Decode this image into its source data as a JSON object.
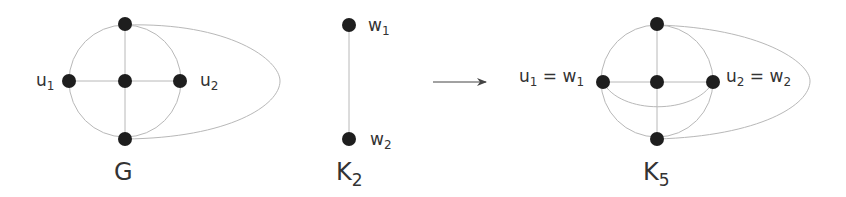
{
  "graphs": {
    "G": {
      "title": "G",
      "labels": {
        "u1": "u",
        "u1_sub": "1",
        "u2": "u",
        "u2_sub": "2"
      }
    },
    "K2": {
      "title": "K",
      "title_sub": "2",
      "labels": {
        "w1": "w",
        "w1_sub": "1",
        "w2": "w",
        "w2_sub": "2"
      }
    },
    "K5": {
      "title": "K",
      "title_sub": "5",
      "labels": {
        "left": "u",
        "left_sub": "1",
        "left_eq": " = w",
        "left_sub2": "1",
        "right": "u",
        "right_sub": "2",
        "right_eq": " = w",
        "right_sub2": "2"
      }
    }
  },
  "arrow": {
    "direction": "right"
  },
  "colors": {
    "node": "#1e1e1e",
    "edge": "#b8b8b8",
    "text": "#333333"
  }
}
